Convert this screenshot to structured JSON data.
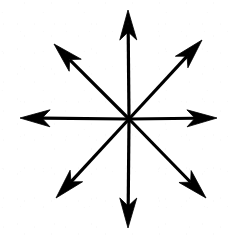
{
  "figure": {
    "background_color": "#ffffff",
    "stroke_color": "#000000",
    "stroke_width": 3.2,
    "arrow_count": 8,
    "canvas": {
      "width": 234,
      "height": 239
    },
    "center": {
      "x": 129,
      "y": 119
    },
    "arrows": [
      {
        "id": "arrow-north",
        "label": "N",
        "direction": "up",
        "angle_deg": 90,
        "tip": {
          "x": 128,
          "y": 10
        },
        "length": 109
      },
      {
        "id": "arrow-northeast",
        "label": "NE",
        "direction": "up-right",
        "angle_deg": 45,
        "tip": {
          "x": 202,
          "y": 40
        },
        "length": 103
      },
      {
        "id": "arrow-east",
        "label": "E",
        "direction": "right",
        "angle_deg": 0,
        "tip": {
          "x": 217,
          "y": 118
        },
        "length": 88
      },
      {
        "id": "arrow-southeast",
        "label": "SE",
        "direction": "down-right",
        "angle_deg": -45,
        "tip": {
          "x": 206,
          "y": 198
        },
        "length": 107
      },
      {
        "id": "arrow-south",
        "label": "S",
        "direction": "down",
        "angle_deg": -90,
        "tip": {
          "x": 128,
          "y": 228
        },
        "length": 109
      },
      {
        "id": "arrow-southwest",
        "label": "SW",
        "direction": "down-left",
        "angle_deg": 225,
        "tip": {
          "x": 56,
          "y": 198
        },
        "length": 105
      },
      {
        "id": "arrow-west",
        "label": "W",
        "direction": "left",
        "angle_deg": 180,
        "tip": {
          "x": 20,
          "y": 118
        },
        "length": 109
      },
      {
        "id": "arrow-northwest",
        "label": "NW",
        "direction": "up-left",
        "angle_deg": 135,
        "tip": {
          "x": 54,
          "y": 44
        },
        "length": 105
      }
    ],
    "arrowhead": {
      "style": "barbed",
      "length": 30,
      "half_width": 8.5,
      "notch_depth": 8
    }
  }
}
